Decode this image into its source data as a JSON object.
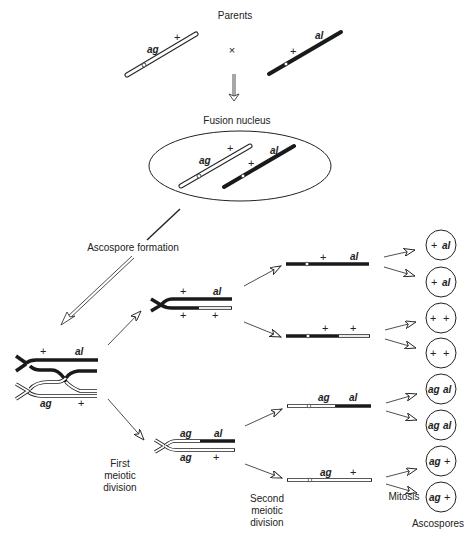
{
  "title": "Parents",
  "cross_symbol": "×",
  "fusion_label": "Fusion nucleus",
  "ascospore_formation_label": "Ascospore formation",
  "first_meiotic_division": [
    "First",
    "meiotic",
    "division"
  ],
  "second_meiotic_division": [
    "Second",
    "meiotic",
    "division"
  ],
  "mitosis_label": "Mitosis",
  "ascospores_label": "Ascospores",
  "alleles": {
    "ag": "ag",
    "al": "al",
    "plus": "+"
  },
  "colors": {
    "ink": "#222222",
    "white_chromosome": "#ffffff",
    "black_chromosome": "#1a1a1a"
  },
  "ascospores": [
    {
      "left": "+",
      "right": "al"
    },
    {
      "left": "+",
      "right": "al"
    },
    {
      "left": "+",
      "right": "+"
    },
    {
      "left": "+",
      "right": "+"
    },
    {
      "left": "ag",
      "right": "al"
    },
    {
      "left": "ag",
      "right": "al"
    },
    {
      "left": "ag",
      "right": "+"
    },
    {
      "left": "ag",
      "right": "+"
    }
  ]
}
